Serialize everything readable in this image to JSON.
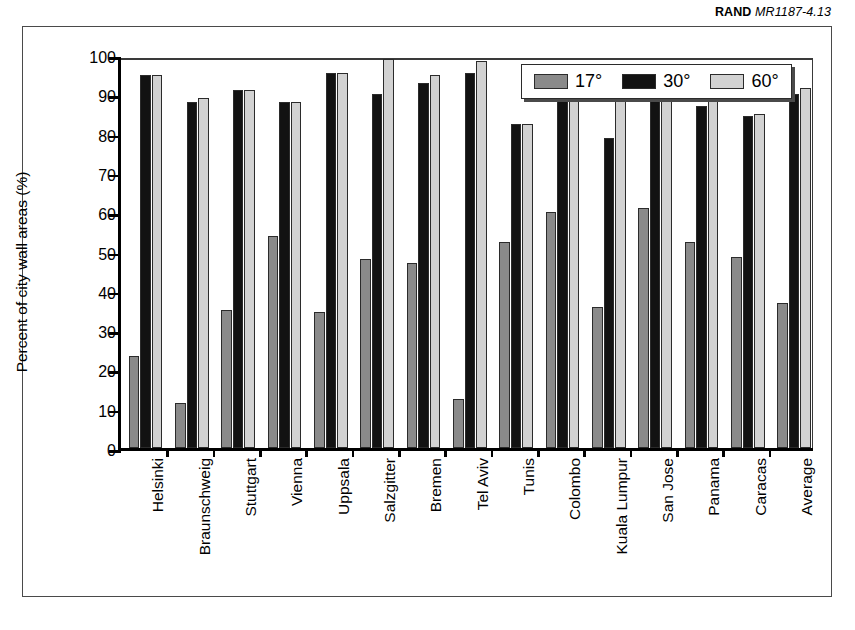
{
  "credit": {
    "org": "RAND",
    "id": "MR1187-4.13"
  },
  "chart_data": {
    "type": "bar",
    "title": "",
    "xlabel": "",
    "ylabel": "Percent of city wall areas (%)",
    "ylim": [
      0,
      100
    ],
    "yticks": [
      0,
      10,
      20,
      30,
      40,
      50,
      60,
      70,
      80,
      90,
      100
    ],
    "grid": false,
    "legend_position": "top-right",
    "categories": [
      "Helsinki",
      "Braunschweig",
      "Stuttgart",
      "Vienna",
      "Uppsala",
      "Salzgitter",
      "Bremen",
      "Tel Aviv",
      "Tunis",
      "Colombo",
      "Kuala Lumpur",
      "San Jose",
      "Panama",
      "Caracas",
      "Average"
    ],
    "series": [
      {
        "name": "17°",
        "color": "#8a8a8a",
        "values": [
          23.5,
          11.5,
          35,
          54,
          34.5,
          48,
          47,
          12.5,
          52.5,
          60,
          36,
          61,
          52.5,
          48.5,
          37
        ]
      },
      {
        "name": "30°",
        "color": "#121212",
        "values": [
          95,
          88,
          91,
          88,
          95.5,
          90,
          93,
          95.5,
          82.5,
          92.5,
          79,
          94,
          87,
          84.5,
          90
        ]
      },
      {
        "name": "60°",
        "color": "#d2d2d2",
        "values": [
          95,
          89,
          91,
          88,
          95.5,
          99,
          95,
          98.5,
          82.5,
          93.5,
          92.5,
          94,
          90,
          85,
          91.5
        ]
      }
    ]
  }
}
